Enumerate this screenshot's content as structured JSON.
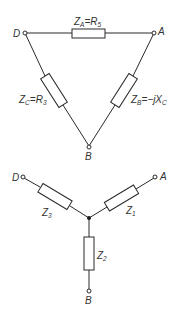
{
  "delta": {
    "nodes": {
      "D": {
        "label": "D"
      },
      "A": {
        "label": "A"
      },
      "B": {
        "label": "B"
      }
    },
    "impedances": {
      "ZA": {
        "symbol": "Z",
        "sub": "A",
        "eq": "=",
        "value": "R",
        "value_sub": "5"
      },
      "ZC": {
        "symbol": "Z",
        "sub": "C",
        "eq": "=",
        "value": "R",
        "value_sub": "3"
      },
      "ZB": {
        "symbol": "Z",
        "sub": "B",
        "eq": "=",
        "value": "−jX",
        "value_sub": "C"
      }
    }
  },
  "star": {
    "nodes": {
      "D": {
        "label": "D"
      },
      "A": {
        "label": "A"
      },
      "B": {
        "label": "B"
      }
    },
    "impedances": {
      "Z1": {
        "symbol": "Z",
        "sub": "1"
      },
      "Z2": {
        "symbol": "Z",
        "sub": "2"
      },
      "Z3": {
        "symbol": "Z",
        "sub": "3"
      }
    }
  }
}
